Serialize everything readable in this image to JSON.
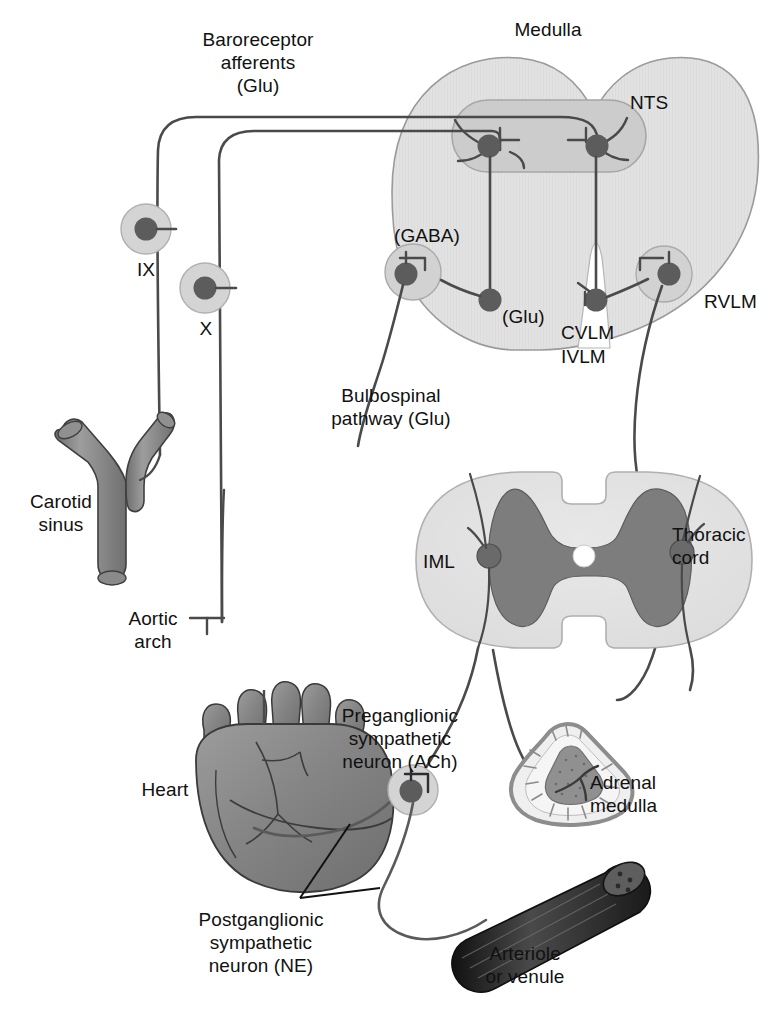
{
  "figure": {
    "type": "anatomical-diagram"
  },
  "labels": {
    "baroreceptor_afferents": "Baroreceptor\nafferents\n(Glu)",
    "medulla": "Medulla",
    "nts": "NTS",
    "gaba": "(GABA)",
    "glu": "(Glu)",
    "cvlm": "CVLM",
    "ivlm": "IVLM",
    "rvlm": "RVLM",
    "ix": "IX",
    "x": "X",
    "carotid_sinus": "Carotid\nsinus",
    "aortic_arch": "Aortic\narch",
    "bulbospinal": "Bulbospinal\npathway (Glu)",
    "iml": "IML",
    "thoracic_cord": "Thoracic\ncord",
    "heart": "Heart",
    "preganglionic": "Preganglionic\nsympathetic\nneuron (ACh)",
    "adrenal_medulla": "Adrenal\nmedulla",
    "postganglionic": "Postganglionic\nsympathetic\nneuron (NE)",
    "arteriole": "Arteriole\nor venule"
  },
  "colors": {
    "background": "#ffffff",
    "text": "#111111",
    "medulla_fill": "#e0e0e0",
    "medulla_stroke": "#9a9a9a",
    "nucleus_fill": "#cfcfcf",
    "nucleus_stroke": "#a8a8a8",
    "neuron_body": "#595959",
    "axon_stroke": "#4a4a4a",
    "cord_white_matter": "#e2e2e2",
    "cord_gray_matter": "#7d7d7d",
    "organ_fill": "#8a8a8a",
    "organ_stroke": "#3a3a3a",
    "vessel_dark": "#2b2b2b",
    "adrenal_cortex": "#ebebeb",
    "adrenal_medulla_core": "#8f8f8f",
    "adrenal_capsule": "#9a9a9a"
  },
  "structures": [
    {
      "name": "medulla",
      "label": "Medulla",
      "kind": "brain-region"
    },
    {
      "name": "nts",
      "label": "NTS",
      "kind": "nucleus"
    },
    {
      "name": "cvlm-ivlm",
      "label": "CVLM IVLM",
      "kind": "nucleus"
    },
    {
      "name": "rvlm",
      "label": "RVLM",
      "kind": "nucleus"
    },
    {
      "name": "thoracic-cord",
      "label": "Thoracic cord",
      "kind": "spinal-cord"
    },
    {
      "name": "iml",
      "label": "IML",
      "kind": "nucleus"
    },
    {
      "name": "carotid-sinus",
      "label": "Carotid sinus",
      "kind": "vessel"
    },
    {
      "name": "aortic-arch",
      "label": "Aortic arch",
      "kind": "vessel"
    },
    {
      "name": "heart",
      "label": "Heart",
      "kind": "organ"
    },
    {
      "name": "adrenal-medulla",
      "label": "Adrenal medulla",
      "kind": "organ"
    },
    {
      "name": "arteriole-or-venule",
      "label": "Arteriole or venule",
      "kind": "vessel"
    }
  ],
  "neurotransmitters": [
    {
      "pathway": "Baroreceptor afferents",
      "transmitter": "Glu"
    },
    {
      "pathway": "NTS to CVLM/IVLM",
      "transmitter": "Glu"
    },
    {
      "pathway": "CVLM/IVLM to RVLM",
      "transmitter": "GABA"
    },
    {
      "pathway": "Bulbospinal pathway",
      "transmitter": "Glu"
    },
    {
      "pathway": "Preganglionic sympathetic neuron",
      "transmitter": "ACh"
    },
    {
      "pathway": "Postganglionic sympathetic neuron",
      "transmitter": "NE"
    }
  ],
  "cranial_nerves": [
    {
      "numeral": "IX",
      "name": "glossopharyngeal"
    },
    {
      "numeral": "X",
      "name": "vagus"
    }
  ]
}
